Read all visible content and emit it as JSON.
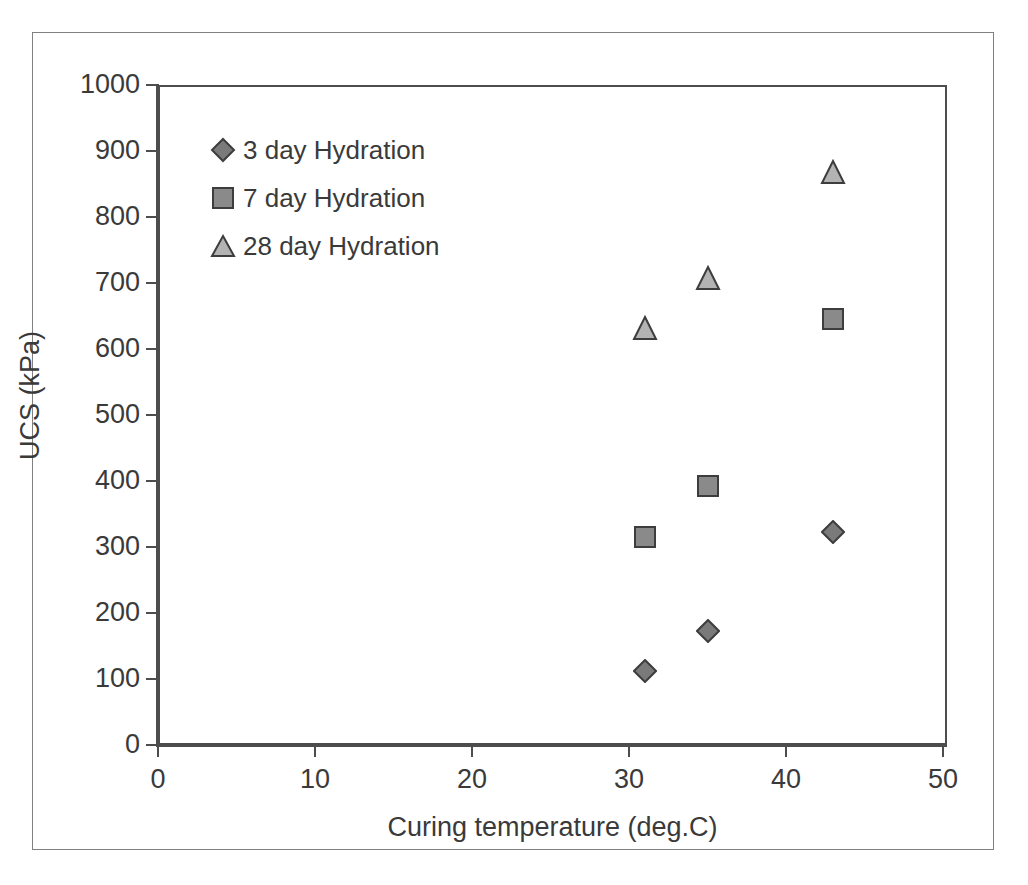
{
  "chart_data": {
    "type": "scatter",
    "title": "",
    "xlabel": "Curing temperature (deg.C)",
    "ylabel": "UCS (kPa)",
    "xlim": [
      0,
      50
    ],
    "ylim": [
      0,
      1000
    ],
    "xticks": [
      0,
      10,
      20,
      30,
      40,
      50
    ],
    "yticks": [
      0,
      100,
      200,
      300,
      400,
      500,
      600,
      700,
      800,
      900,
      1000
    ],
    "grid": false,
    "legend_position": "top-left inside plot",
    "series": [
      {
        "name": "3 day Hydration",
        "marker": "diamond",
        "fill": "#7a7a7a",
        "stroke": "#3d3d3d",
        "x": [
          31,
          35,
          43
        ],
        "values": [
          112,
          172,
          322
        ]
      },
      {
        "name": "7 day Hydration",
        "marker": "square",
        "fill": "#8a8a8a",
        "stroke": "#3d3d3d",
        "x": [
          31,
          35,
          43
        ],
        "values": [
          315,
          393,
          645
        ]
      },
      {
        "name": "28 day Hydration",
        "marker": "triangle",
        "fill": "#b3b3b3",
        "stroke": "#3d3d3d",
        "x": [
          31,
          35,
          43
        ],
        "values": [
          632,
          708,
          868
        ]
      }
    ]
  },
  "axes": {
    "x_title": "Curing temperature (deg.C)",
    "y_title": "UCS (kPa)",
    "x_tick_labels": [
      "0",
      "10",
      "20",
      "30",
      "40",
      "50"
    ],
    "y_tick_labels": [
      "0",
      "100",
      "200",
      "300",
      "400",
      "500",
      "600",
      "700",
      "800",
      "900",
      "1000"
    ]
  },
  "legend": {
    "entries": [
      {
        "label": "3 day Hydration",
        "marker": "diamond-marker-icon"
      },
      {
        "label": "7 day Hydration",
        "marker": "square-marker-icon"
      },
      {
        "label": "28 day Hydration",
        "marker": "triangle-marker-icon"
      }
    ]
  },
  "colors": {
    "axis": "#4d4d4d",
    "text": "#3a3a3a",
    "frame": "#808080",
    "background": "#ffffff",
    "series_3day": "#7a7a7a",
    "series_7day": "#8a8a8a",
    "series_28day": "#b3b3b3"
  }
}
